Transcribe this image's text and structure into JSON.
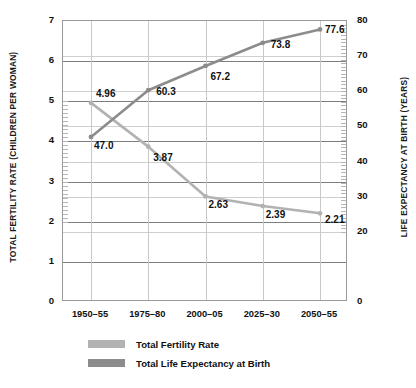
{
  "chart_data": {
    "type": "line",
    "title": "",
    "categories": [
      "1950–55",
      "1975–80",
      "2000–05",
      "2025–30",
      "2050–55"
    ],
    "series": [
      {
        "name": "Total Fertility Rate",
        "axis": "left",
        "color": "#b2b2b2",
        "values": [
          4.96,
          3.87,
          2.63,
          2.39,
          2.21
        ],
        "labels": [
          "4.96",
          "3.87",
          "2.63",
          "2.39",
          "2.21"
        ]
      },
      {
        "name": "Total Life Expectancy at Birth",
        "axis": "right",
        "color": "#8c8c8c",
        "values": [
          47.0,
          60.3,
          67.2,
          73.8,
          77.6
        ],
        "labels": [
          "47.0",
          "60.3",
          "67.2",
          "73.8",
          "77.6"
        ]
      }
    ],
    "xlabel": "",
    "ylabel": "TOTAL FERTILITY RATE (CHILDREN PER WOMAN)",
    "y2label": "LIFE EXPECTANCY AT BIRTH (YEARS)",
    "ylim": [
      0,
      7
    ],
    "y2lim": [
      0,
      80
    ],
    "yticks": [
      7,
      6,
      5,
      4,
      3,
      2,
      1,
      0
    ],
    "y2ticks": [
      80,
      70,
      60,
      50,
      40,
      30,
      20,
      0
    ],
    "grid": true,
    "legend_position": "bottom-left"
  },
  "axes": {
    "left_title": "TOTAL FERTILITY RATE (CHILDREN PER WOMAN)",
    "right_title": "LIFE EXPECTANCY AT BIRTH (YEARS)",
    "left_ticks": [
      "7",
      "6",
      "5",
      "4",
      "3",
      "2",
      "1",
      "0"
    ],
    "right_ticks": [
      "80",
      "70",
      "60",
      "50",
      "40",
      "30",
      "20",
      "0"
    ],
    "x_ticks": [
      "1950–55",
      "1975–80",
      "2000–05",
      "2025–30",
      "2050–55"
    ]
  },
  "legend": {
    "items": [
      {
        "label": "Total Fertility Rate",
        "color": "#b2b2b2"
      },
      {
        "label": "Total Life Expectancy at Birth",
        "color": "#8c8c8c"
      }
    ]
  },
  "colors": {
    "fertility": "#b2b2b2",
    "life_expectancy": "#8c8c8c",
    "frame": "#9a9a9a",
    "gridline": "#7e7e7e",
    "gridline_minor": "#cfcfcf",
    "text": "#111111",
    "background": "#ffffff"
  }
}
